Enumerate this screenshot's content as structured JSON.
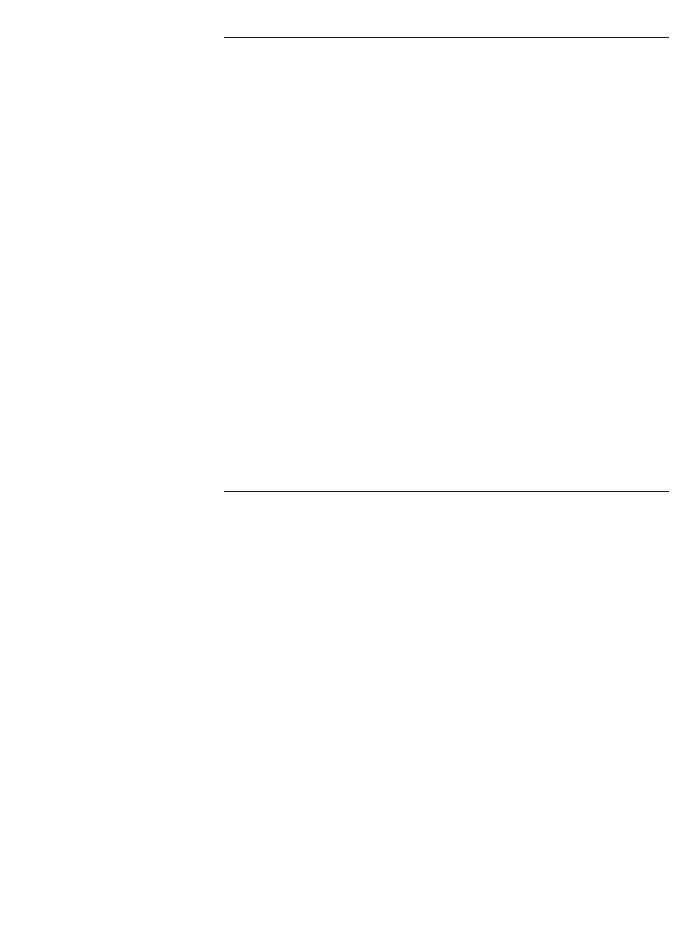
{
  "chart_data": [
    {
      "id": "top",
      "type": "bar",
      "orientation": "horizontal",
      "title": "",
      "xlabel": "",
      "ylabel": "",
      "xlim": [
        0,
        15
      ],
      "ticks": [
        0,
        5,
        10,
        15
      ],
      "tick_labels": [
        "0",
        "5",
        "10",
        "15"
      ],
      "grid": false,
      "legend": "none",
      "star_note": "*",
      "categories": [
        "Ireland, Southern",
        "Hungary, Szabolcs-Szatmar",
        "Romania, County Cluj",
        "Spain, Navarra",
        "Canada",
        "Brazil, Sao Paulo",
        "Australia, New South Wales",
        "Denmark",
        "US, Los Angeles: Other White",
        "Israel: All Jews",
        "Norway",
        "Yugoslavia, Slovenia",
        "Poland, Cracow City",
        "Sweden",
        "Italy, Varese",
        "UK, Scotland",
        "German Democratic Republic",
        "Switzerland, Geneva",
        "Netherlands, Eindhoven",
        "US, Connecticut: White",
        "Colombia, Cali",
        "FRG, Saarland",
        "US, Puerto Rico",
        "France, Bas-Rhin",
        "UK, England & Wales",
        "US, Los Angeles: Black",
        "India, Bombay",
        "Singapore: Indian",
        "China, Shanghai",
        "Hong Kong",
        "Costa Rica",
        "Japan, Miyagi",
        "Philippines, Rizal",
        "Singapore: Chinese",
        "US, Los Angeles: Chinese",
        "US, Los Angeles: Japanese",
        "US, Connecticut: Black",
        "Kuwait: Kuwaitis",
        "New Zealand: Maori",
        "Hawaii: Hawaiian"
      ],
      "values": [
        11.6,
        8.4,
        8.3,
        7.7,
        5.5,
        5.4,
        4.2,
        3.8,
        3.6,
        3.6,
        3.2,
        3.1,
        2.7,
        2.5,
        2.4,
        2.4,
        1.7,
        1.5,
        1.4,
        1.3,
        1.0,
        0.9,
        0.8,
        0.7,
        0.7,
        0.5,
        0.3,
        0.3,
        0.2,
        0.2,
        0.1,
        0.1,
        0.1,
        0.1,
        0.0,
        0.0,
        0.0,
        0.0,
        0.0,
        0.0
      ],
      "value_labels": [
        "11.6",
        "8.4",
        "8.3",
        "7.7",
        "5.5",
        "5.4",
        "4.2",
        "3.8",
        "3.6",
        "3.6",
        "3.2",
        "3.1",
        "2.7",
        "2.5",
        "2.4",
        "2.4",
        "1.7",
        "1.5",
        "1.4",
        "1.3",
        "1.0",
        "0.9",
        "0.8",
        "0.7",
        "0.7",
        "0.5",
        "0.3",
        "0.3",
        "0.2",
        "0.2",
        "0.1",
        "0.1",
        "0.1",
        "0.1",
        "0.0",
        "0.0",
        "0.0",
        "0.0",
        "0.0",
        "0.0"
      ],
      "starred": [
        false,
        false,
        false,
        false,
        false,
        false,
        false,
        false,
        false,
        false,
        false,
        false,
        false,
        false,
        false,
        false,
        false,
        false,
        false,
        false,
        false,
        false,
        false,
        false,
        false,
        false,
        false,
        true,
        false,
        false,
        true,
        true,
        true,
        true,
        true,
        true,
        true,
        true,
        true,
        true
      ],
      "extra_categories": [
        "Canada, Newfoundland",
        "Japan, Osaka"
      ],
      "extra_values": [
        15.1,
        0.1
      ],
      "extra_value_labels": [
        "15.1",
        "0.1"
      ],
      "extra_starred": [
        false,
        false
      ]
    },
    {
      "id": "bottom",
      "type": "bar",
      "orientation": "horizontal",
      "title": "",
      "xlabel": "",
      "ylabel": "",
      "xlim": [
        0,
        15
      ],
      "ticks": [
        0,
        5,
        10,
        15
      ],
      "tick_labels": [
        "0",
        "5",
        "10",
        "15"
      ],
      "grid": false,
      "legend": "none",
      "star_note": "*",
      "categories": [
        "Brazil, Sao Paulo",
        "Ireland, Southern",
        "Hungary, Szabolcs-Szatmar",
        "Romania, County Cluj",
        "Israel: All Jews",
        "Australia, New South Wales",
        "Spain, Navarra",
        "Yugoslavia, Slovenia",
        "Canada",
        "US, Los Angeles: Other White",
        "Denmark",
        "Italy, Varese",
        "Colombia, Cali",
        "Norway",
        "Poland, Cracow City",
        "Sweden",
        "US, Puerto Rico",
        "US, Los Angeles: Black",
        "US, Connecticut: White",
        "India, Bombay",
        "Philippines, Rizal",
        "German Democratic Republic",
        "Switzerland, Geneva",
        "UK, Scotland",
        "China, Shanghai",
        "Hong Kong",
        "Kuwait: Kuwaitis",
        "FRG, Saarland",
        "UK, England & Wales",
        "Costa Rica",
        "US, Los Angeles: Chinese",
        "US, Los Angeles: Japanese",
        "US, Connecticut: Black",
        "Japan, Miyagi",
        "Singapore: Chinese",
        "Singapore: Indian",
        "France, Bas-Rhin",
        "Netherlands, Eindhoven",
        "New Zealand: Maori",
        "Hawaii: Hawaiian"
      ],
      "values": [
        1.3,
        1.2,
        1.1,
        1.1,
        0.8,
        0.8,
        0.7,
        0.6,
        0.5,
        0.4,
        0.4,
        0.4,
        0.3,
        0.3,
        0.3,
        0.3,
        0.2,
        0.2,
        0.2,
        0.2,
        0.2,
        0.2,
        0.2,
        0.2,
        0.1,
        0.1,
        0.1,
        0.1,
        0.1,
        0.0,
        0.0,
        0.0,
        0.0,
        0.0,
        0.0,
        0.0,
        0.0,
        0.0,
        0.0,
        0.0
      ],
      "value_labels": [
        "1.3",
        "1.2",
        "1.1",
        "1.1",
        "0.8",
        "0.8",
        "0.7",
        "0.6",
        "0.5",
        "0.4",
        "0.4",
        "0.4",
        "0.3",
        "0.3",
        "0.3",
        "0.3",
        "0.2",
        "0.2",
        "0.2",
        "0.2",
        "0.2",
        "0.2",
        "0.2",
        "0.2",
        "0.1",
        "0.1",
        "0.1",
        "0.1",
        "0.1",
        "0.0",
        "0.0",
        "0.0",
        "0.0",
        "0.0",
        "0.0",
        "0.0",
        "0.0",
        "0.0",
        "0.0",
        "0.0"
      ],
      "starred": [
        false,
        false,
        false,
        false,
        false,
        false,
        false,
        false,
        false,
        false,
        false,
        false,
        true,
        false,
        true,
        false,
        false,
        true,
        false,
        false,
        true,
        false,
        true,
        false,
        false,
        false,
        true,
        true,
        false,
        true,
        true,
        true,
        true,
        true,
        true,
        true,
        true,
        true,
        true,
        true
      ],
      "extra_categories": [
        "South Australia",
        "UK, South Western"
      ],
      "extra_values": [
        1.6,
        0.1
      ],
      "extra_value_labels": [
        "1.6",
        "0.1"
      ],
      "extra_starred": [
        false,
        false
      ]
    }
  ],
  "style": {
    "bar_color": "#2b2b2b",
    "axis_color": "#1a1a1a",
    "text_color": "#111111",
    "background": "#ffffff"
  }
}
